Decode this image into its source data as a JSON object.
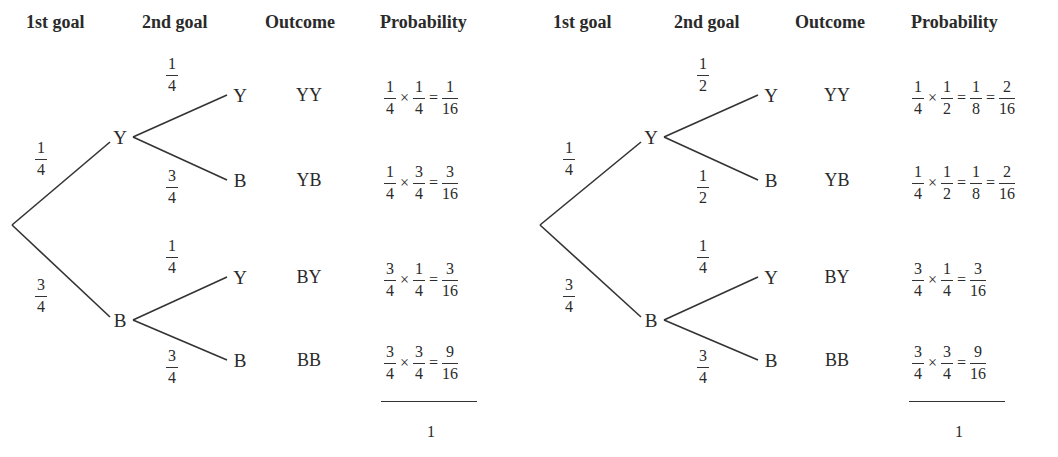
{
  "headers": [
    "1st goal",
    "2nd goal",
    "Outcome",
    "Probability"
  ],
  "trees": [
    {
      "first": [
        {
          "label": "Y",
          "prob": {
            "n": "1",
            "d": "4"
          }
        },
        {
          "label": "B",
          "prob": {
            "n": "3",
            "d": "4"
          }
        }
      ],
      "second": [
        {
          "parent": "Y",
          "label": "Y",
          "prob": {
            "n": "1",
            "d": "4"
          },
          "outcome": "YY",
          "terms": [
            {
              "n": "1",
              "d": "4"
            },
            {
              "n": "1",
              "d": "4"
            }
          ],
          "results": [
            {
              "n": "1",
              "d": "16"
            }
          ]
        },
        {
          "parent": "Y",
          "label": "B",
          "prob": {
            "n": "3",
            "d": "4"
          },
          "outcome": "YB",
          "terms": [
            {
              "n": "1",
              "d": "4"
            },
            {
              "n": "3",
              "d": "4"
            }
          ],
          "results": [
            {
              "n": "3",
              "d": "16"
            }
          ]
        },
        {
          "parent": "B",
          "label": "Y",
          "prob": {
            "n": "1",
            "d": "4"
          },
          "outcome": "BY",
          "terms": [
            {
              "n": "3",
              "d": "4"
            },
            {
              "n": "1",
              "d": "4"
            }
          ],
          "results": [
            {
              "n": "3",
              "d": "16"
            }
          ]
        },
        {
          "parent": "B",
          "label": "B",
          "prob": {
            "n": "3",
            "d": "4"
          },
          "outcome": "BB",
          "terms": [
            {
              "n": "3",
              "d": "4"
            },
            {
              "n": "3",
              "d": "4"
            }
          ],
          "results": [
            {
              "n": "9",
              "d": "16"
            }
          ]
        }
      ],
      "total": "1"
    },
    {
      "first": [
        {
          "label": "Y",
          "prob": {
            "n": "1",
            "d": "4"
          }
        },
        {
          "label": "B",
          "prob": {
            "n": "3",
            "d": "4"
          }
        }
      ],
      "second": [
        {
          "parent": "Y",
          "label": "Y",
          "prob": {
            "n": "1",
            "d": "2"
          },
          "outcome": "YY",
          "terms": [
            {
              "n": "1",
              "d": "4"
            },
            {
              "n": "1",
              "d": "2"
            }
          ],
          "results": [
            {
              "n": "1",
              "d": "8"
            },
            {
              "n": "2",
              "d": "16"
            }
          ]
        },
        {
          "parent": "Y",
          "label": "B",
          "prob": {
            "n": "1",
            "d": "2"
          },
          "outcome": "YB",
          "terms": [
            {
              "n": "1",
              "d": "4"
            },
            {
              "n": "1",
              "d": "2"
            }
          ],
          "results": [
            {
              "n": "1",
              "d": "8"
            },
            {
              "n": "2",
              "d": "16"
            }
          ]
        },
        {
          "parent": "B",
          "label": "Y",
          "prob": {
            "n": "1",
            "d": "4"
          },
          "outcome": "BY",
          "terms": [
            {
              "n": "3",
              "d": "4"
            },
            {
              "n": "1",
              "d": "4"
            }
          ],
          "results": [
            {
              "n": "3",
              "d": "16"
            }
          ]
        },
        {
          "parent": "B",
          "label": "B",
          "prob": {
            "n": "3",
            "d": "4"
          },
          "outcome": "BB",
          "terms": [
            {
              "n": "3",
              "d": "4"
            },
            {
              "n": "3",
              "d": "4"
            }
          ],
          "results": [
            {
              "n": "9",
              "d": "16"
            }
          ]
        }
      ],
      "total": "1"
    }
  ],
  "symbols": {
    "times": "×",
    "equals": "="
  }
}
